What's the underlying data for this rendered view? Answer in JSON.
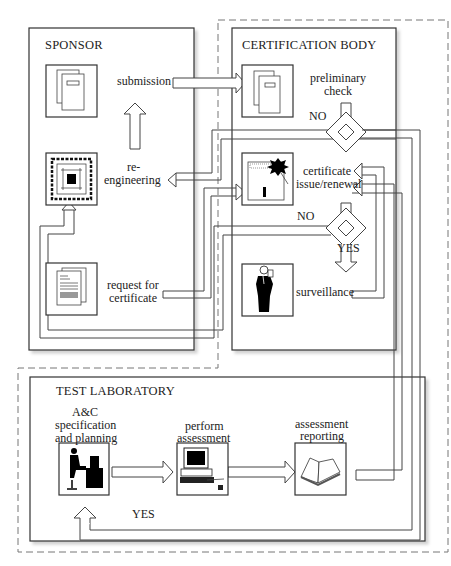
{
  "diagram": {
    "type": "process-flow",
    "colors": {
      "line": "#333333",
      "shadow": "#d9d9d9",
      "dashed": "#777777",
      "background": "#ffffff"
    },
    "groups": {
      "sponsor": {
        "title": "SPONSOR"
      },
      "certification_body": {
        "title": "CERTIFICATION BODY"
      },
      "test_laboratory": {
        "title": "TEST LABORATORY"
      }
    },
    "labels": {
      "submission": "submission",
      "re_engineering_1": "re-",
      "re_engineering_2": "engineering",
      "request_1": "request for",
      "request_2": "certificate",
      "preliminary_1": "preliminary",
      "preliminary_2": "check",
      "certificate_1": "certificate",
      "certificate_2": "issue/renewal",
      "surveillance": "surveillance",
      "ac_1": "A&C",
      "ac_2": "specification",
      "ac_3": "and planning",
      "perform_1": "perform",
      "perform_2": "assessment",
      "reporting_1": "assessment",
      "reporting_2": "reporting"
    },
    "decisions": {
      "preliminary_no": "NO",
      "certificate_no": "NO",
      "certificate_yes": "YES",
      "lab_yes": "YES"
    },
    "icons": [
      "documents-icon",
      "chip-icon",
      "request-document-icon",
      "certificate-icon",
      "inspector-icon",
      "worker-at-desk-icon",
      "computer-terminal-icon",
      "open-book-icon"
    ]
  }
}
